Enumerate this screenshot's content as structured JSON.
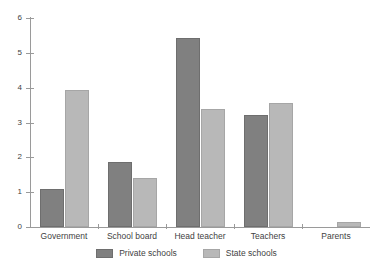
{
  "chart_data": {
    "type": "bar",
    "title": "",
    "xlabel": "",
    "ylabel": "",
    "ylim": [
      0,
      6
    ],
    "yticks": [
      0,
      1,
      2,
      3,
      4,
      5,
      6
    ],
    "grid": false,
    "legend_position": "bottom-center",
    "categories": [
      "Government",
      "School board",
      "Head teacher",
      "Teachers",
      "Parents"
    ],
    "series": [
      {
        "name": "Private schools",
        "color": "#808080",
        "values": [
          1.1,
          1.88,
          5.43,
          3.22,
          0
        ]
      },
      {
        "name": "State schools",
        "color": "#b8b8b8",
        "values": [
          3.93,
          1.42,
          3.39,
          3.56,
          0.15
        ]
      }
    ]
  },
  "axis": {
    "y_tick_labels": [
      "0",
      "1",
      "2",
      "3",
      "4",
      "5",
      "6"
    ]
  },
  "legend": {
    "items": [
      {
        "label": "Private schools",
        "color": "#808080"
      },
      {
        "label": "State schools",
        "color": "#b8b8b8"
      }
    ]
  },
  "title_remnant": ""
}
